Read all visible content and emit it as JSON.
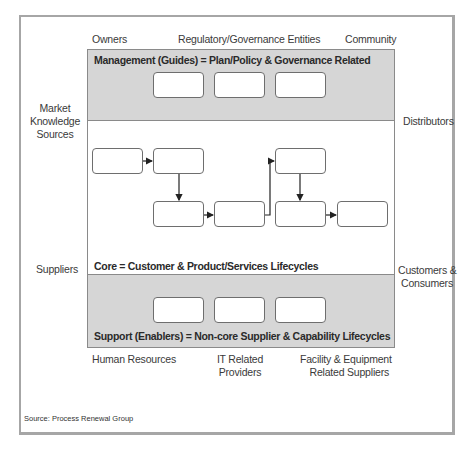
{
  "diagram": {
    "stakeholders_top": {
      "left": "Owners",
      "center": "Regulatory/Governance Entities",
      "right": "Community"
    },
    "stakeholders_left": {
      "upper": [
        "Market",
        "Knowledge",
        "Sources"
      ],
      "lower": "Suppliers"
    },
    "stakeholders_right": {
      "upper": "Distributors",
      "lower": [
        "Customers &",
        "Consumers"
      ]
    },
    "stakeholders_bottom": {
      "left": "Human Resources",
      "center": [
        "IT Related",
        "Providers"
      ],
      "right": [
        "Facility & Equipment",
        "Related Suppliers"
      ]
    },
    "bands": {
      "management": {
        "title": "Management (Guides) = Plan/Policy & Governance Related",
        "box_count": 3,
        "fill": "#d6d6d6"
      },
      "core": {
        "title": "Core = Customer & Product/Services Lifecycles",
        "box_count": 6,
        "fill": "#ffffff"
      },
      "support": {
        "title": "Support (Enablers) = Non-core Supplier & Capability Lifecycles",
        "box_count": 3,
        "fill": "#d6d6d6"
      }
    },
    "core_flow": [
      {
        "from": "core-box-1",
        "to": "core-box-2",
        "direction": "right"
      },
      {
        "from": "core-box-2",
        "to": "core-box-3",
        "direction": "down"
      },
      {
        "from": "core-box-3",
        "to": "core-box-4",
        "direction": "right"
      },
      {
        "from": "core-box-4",
        "to": "core-box-5",
        "direction": "up-right"
      },
      {
        "from": "core-box-5",
        "to": "core-box-6",
        "direction": "down"
      },
      {
        "from": "core-box-6",
        "to": "core-box-7",
        "direction": "right"
      }
    ],
    "source": "Source: Process Renewal  Group"
  }
}
